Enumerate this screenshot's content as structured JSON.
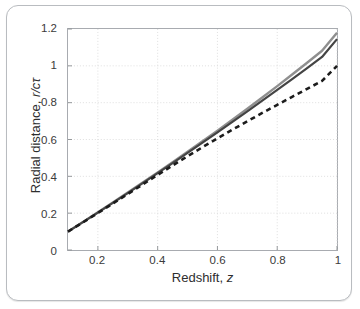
{
  "figure": {
    "background": "#ffffff",
    "frame_color": "#b9bcc0"
  },
  "axes": {
    "x_title_prefix": "Redshift, ",
    "x_title_symbol": "z",
    "y_title_prefix": "Radial distance, ",
    "y_title_symbol": "r/cτ"
  },
  "chart_data": {
    "type": "line",
    "title": "",
    "xlabel": "Redshift, z",
    "ylabel": "Radial distance, r/cτ",
    "xlim": [
      0.1,
      1.0
    ],
    "ylim": [
      0.0,
      1.2
    ],
    "xticks": [
      0.2,
      0.4,
      0.6,
      0.8,
      1
    ],
    "xtick_labels": [
      "0.2",
      "0.4",
      "0.6",
      "0.8",
      "1"
    ],
    "yticks": [
      0,
      0.2,
      0.4,
      0.6,
      0.8,
      1,
      1.2
    ],
    "ytick_labels": [
      "0",
      "0.2",
      "0.4",
      "0.6",
      "0.8",
      "1",
      "1.2"
    ],
    "grid": true,
    "grid_style": "dotted",
    "grid_color": "#d6d6d6",
    "legend": "none",
    "x": [
      0.1,
      0.15,
      0.2,
      0.25,
      0.3,
      0.35,
      0.4,
      0.45,
      0.5,
      0.55,
      0.6,
      0.65,
      0.7,
      0.75,
      0.8,
      0.85,
      0.9,
      0.95,
      1.0
    ],
    "series": [
      {
        "name": "gray-solid",
        "color": "#8f8f8f",
        "style": "solid",
        "width": 2.4,
        "values": [
          0.1,
          0.152,
          0.205,
          0.258,
          0.312,
          0.366,
          0.421,
          0.477,
          0.533,
          0.59,
          0.648,
          0.707,
          0.767,
          0.828,
          0.89,
          0.953,
          1.017,
          1.082,
          1.18
        ]
      },
      {
        "name": "dark-solid",
        "color": "#444444",
        "style": "solid",
        "width": 2.2,
        "values": [
          0.1,
          0.151,
          0.203,
          0.256,
          0.309,
          0.363,
          0.417,
          0.472,
          0.527,
          0.583,
          0.639,
          0.696,
          0.753,
          0.811,
          0.869,
          0.928,
          0.988,
          1.048,
          1.145
        ]
      },
      {
        "name": "black-dashed",
        "color": "#1c1c1c",
        "style": "dashed",
        "width": 2.6,
        "values": [
          0.1,
          0.15,
          0.201,
          0.252,
          0.304,
          0.356,
          0.408,
          0.459,
          0.509,
          0.558,
          0.606,
          0.653,
          0.699,
          0.744,
          0.788,
          0.832,
          0.875,
          0.918,
          1.0
        ]
      }
    ]
  }
}
